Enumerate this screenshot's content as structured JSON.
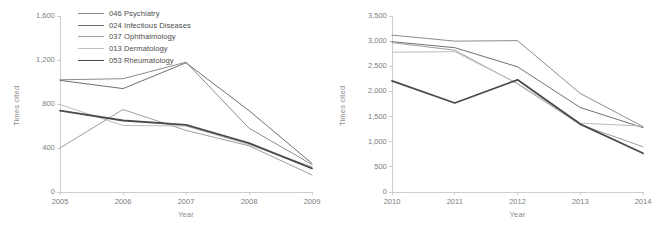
{
  "figure": {
    "background": "#ffffff",
    "panels": [
      "left",
      "right"
    ]
  },
  "legend": {
    "position": "top-left-of-left-panel",
    "entries": [
      {
        "label": "046 Psychiatry",
        "color": "#8c8c8c",
        "width": 1.0
      },
      {
        "label": "024 Infectious Diseases",
        "color": "#707070",
        "width": 1.0
      },
      {
        "label": "037 Ophthalmology",
        "color": "#9e9e9e",
        "width": 1.0
      },
      {
        "label": "013 Dermatology",
        "color": "#bdbdbd",
        "width": 1.0
      },
      {
        "label": "053 Rheumatology",
        "color": "#4a4a4a",
        "width": 1.8
      }
    ]
  },
  "left_panel": {
    "ylabel": "Times cited",
    "xlabel": "Year"
  },
  "right_panel": {
    "ylabel": "Times cited",
    "xlabel": "Year"
  },
  "chart_data": [
    {
      "type": "line",
      "panel": "left",
      "title": "",
      "xlabel": "Year",
      "ylabel": "Times cited",
      "categories": [
        "2005",
        "2006",
        "2007",
        "2008",
        "2009"
      ],
      "x": [
        2005,
        2006,
        2007,
        2008,
        2009
      ],
      "xlim": [
        2005,
        2009
      ],
      "ylim": [
        0,
        1600
      ],
      "yticks": [
        0,
        400,
        800,
        1200,
        1600
      ],
      "ytick_labels": [
        "0",
        "400",
        "800",
        "1,200",
        "1,600"
      ],
      "xtick_labels": [
        "2005",
        "2006",
        "2007",
        "2008",
        "2009"
      ],
      "grid": false,
      "legend_position": "upper left",
      "series": [
        {
          "name": "046 Psychiatry",
          "color": "#8c8c8c",
          "values": [
            1020,
            1030,
            1180,
            580,
            250
          ]
        },
        {
          "name": "024 Infectious Diseases",
          "color": "#707070",
          "values": [
            1015,
            940,
            1175,
            740,
            260
          ]
        },
        {
          "name": "037 Ophthalmology",
          "color": "#9e9e9e",
          "values": [
            400,
            750,
            560,
            420,
            155
          ]
        },
        {
          "name": "013 Dermatology",
          "color": "#bdbdbd",
          "values": [
            795,
            605,
            600,
            430,
            230
          ]
        },
        {
          "name": "053 Rheumatology",
          "color": "#4a4a4a",
          "values": [
            740,
            650,
            610,
            445,
            215
          ]
        }
      ]
    },
    {
      "type": "line",
      "panel": "right",
      "title": "",
      "xlabel": "Year",
      "ylabel": "Times cited",
      "categories": [
        "2010",
        "2011",
        "2012",
        "2013",
        "2014"
      ],
      "x": [
        2010,
        2011,
        2012,
        2013,
        2014
      ],
      "xlim": [
        2010,
        2014
      ],
      "ylim": [
        0,
        3500
      ],
      "yticks": [
        0,
        500,
        1000,
        1500,
        2000,
        2500,
        3000,
        3500
      ],
      "ytick_labels": [
        "0",
        "500",
        "1,000",
        "1,500",
        "2,000",
        "2,500",
        "3,000",
        "3,500"
      ],
      "xtick_labels": [
        "2010",
        "2011",
        "2012",
        "2013",
        "2014"
      ],
      "grid": false,
      "legend_position": "none",
      "series": [
        {
          "name": "046 Psychiatry",
          "color": "#8c8c8c",
          "values": [
            3120,
            3000,
            3010,
            1960,
            1300
          ]
        },
        {
          "name": "024 Infectious Diseases",
          "color": "#707070",
          "values": [
            2990,
            2870,
            2490,
            1680,
            1280
          ]
        },
        {
          "name": "037 Ophthalmology",
          "color": "#9e9e9e",
          "values": [
            2970,
            2820,
            2150,
            1340,
            900
          ]
        },
        {
          "name": "013 Dermatology",
          "color": "#bdbdbd",
          "values": [
            2780,
            2790,
            2160,
            1370,
            1310
          ]
        },
        {
          "name": "053 Rheumatology",
          "color": "#4a4a4a",
          "values": [
            2210,
            1770,
            2230,
            1350,
            770
          ]
        }
      ]
    }
  ]
}
